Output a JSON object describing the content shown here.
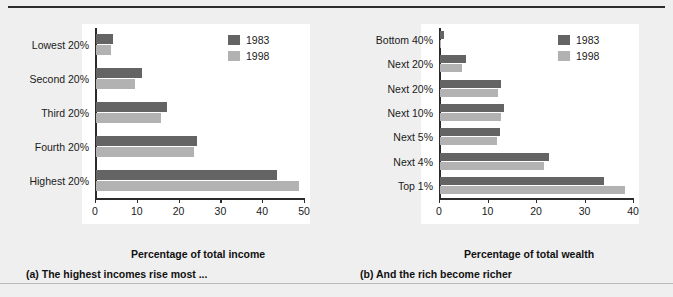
{
  "legend": {
    "entries": [
      {
        "label": "1983",
        "color": "#646464"
      },
      {
        "label": "1998",
        "color": "#b2b2b2"
      }
    ]
  },
  "panels": [
    {
      "id": "panel-a",
      "caption": "(a) The highest incomes rise most ...",
      "xlabel": "Percentage of total income",
      "xticks": [
        "0",
        "10",
        "20",
        "30",
        "40",
        "50"
      ]
    },
    {
      "id": "panel-b",
      "caption": "(b) And the rich become richer",
      "xlabel": "Percentage of total wealth",
      "xticks": [
        "0",
        "10",
        "20",
        "30",
        "40"
      ]
    }
  ],
  "chart_data": [
    {
      "type": "bar",
      "orientation": "horizontal",
      "title": "(a) The highest incomes rise most ...",
      "xlabel": "Percentage of total income",
      "ylabel": "",
      "xlim": [
        0,
        50
      ],
      "grid": false,
      "legend_position": "top-right",
      "categories": [
        "Lowest 20%",
        "Second 20%",
        "Third 20%",
        "Fourth 20%",
        "Highest 20%"
      ],
      "series": [
        {
          "name": "1983",
          "color": "#646464",
          "values": [
            4.1,
            11.0,
            17.1,
            24.1,
            43.4
          ]
        },
        {
          "name": "1998",
          "color": "#b2b2b2",
          "values": [
            3.6,
            9.3,
            15.6,
            23.4,
            48.5
          ]
        }
      ]
    },
    {
      "type": "bar",
      "orientation": "horizontal",
      "title": "(b) And the rich become richer",
      "xlabel": "Percentage of total wealth",
      "ylabel": "",
      "xlim": [
        0,
        40
      ],
      "grid": false,
      "legend_position": "top-right",
      "categories": [
        "Bottom 40%",
        "Next 20%",
        "Next 20%",
        "Next 10%",
        "Next 5%",
        "Next 4%",
        "Top 1%"
      ],
      "series": [
        {
          "name": "1983",
          "color": "#646464",
          "values": [
            0.9,
            5.3,
            12.6,
            13.1,
            12.3,
            22.4,
            33.8
          ]
        },
        {
          "name": "1998",
          "color": "#b2b2b2",
          "values": [
            0.2,
            4.5,
            12.0,
            12.6,
            11.7,
            21.5,
            38.1
          ]
        }
      ]
    }
  ]
}
